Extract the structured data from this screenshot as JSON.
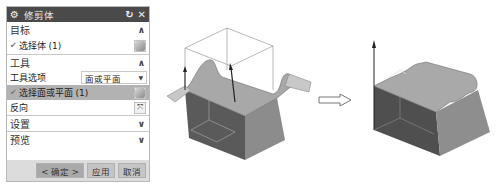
{
  "dialog": {
    "title": "修剪体",
    "title_icon": "gear-icon",
    "reset_icon": "↻",
    "close_icon": "✕",
    "sections": {
      "target": {
        "label": "目标",
        "chevron": "∧",
        "select_body": {
          "check": "✔",
          "label": "选择体 (1)"
        }
      },
      "tool": {
        "label": "工具",
        "chevron": "∧",
        "tool_option_label": "工具选项",
        "tool_option_value": "面或平面",
        "tool_option_caret": "▼",
        "select_face": {
          "check": "✔",
          "label": "选择面或平面 (1)"
        },
        "reverse_label": "反向",
        "reverse_icon": "⤧"
      },
      "settings": {
        "label": "设置",
        "chevron": "∨"
      },
      "preview": {
        "label": "预览",
        "chevron": "∨"
      }
    },
    "buttons": {
      "ok": "< 确定 >",
      "apply": "应用",
      "cancel": "取消"
    }
  },
  "graphics": {
    "before_model": "trim-body-before-with-tool-surface",
    "transition_arrow": "right-arrow",
    "after_model": "trim-body-after"
  }
}
